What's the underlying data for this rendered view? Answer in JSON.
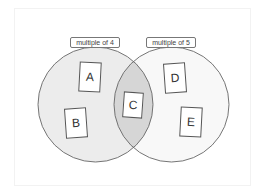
{
  "diagram": {
    "type": "venn",
    "sets": [
      {
        "id": "left",
        "label": "multiple of 4",
        "fill": "#ececec",
        "stroke": "#666666"
      },
      {
        "id": "right",
        "label": "multiple of 5",
        "fill": "#f8f8f8",
        "stroke": "#666666"
      }
    ],
    "overlap_fill": "#d6d6d6",
    "cards": [
      {
        "label": "A",
        "region": "multiple of 4 only"
      },
      {
        "label": "B",
        "region": "multiple of 4 only"
      },
      {
        "label": "C",
        "region": "both"
      },
      {
        "label": "D",
        "region": "multiple of 5 only"
      },
      {
        "label": "E",
        "region": "multiple of 5 only"
      }
    ]
  }
}
